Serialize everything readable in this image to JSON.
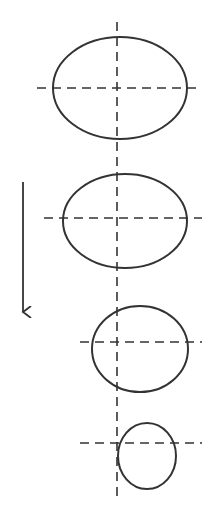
{
  "diagram": {
    "title": "",
    "colors": {
      "stroke": "#333333",
      "background": "#ffffff"
    },
    "vertical_axis": {
      "x": 117,
      "y1": 22,
      "y2": 497
    },
    "arrow": {
      "x": 23,
      "y1": 182,
      "y2": 312,
      "direction": "down"
    },
    "shapes": [
      {
        "id": "ellipse-1",
        "cx": 120,
        "cy": 88,
        "rx": 67,
        "ry": 51,
        "hline": {
          "y": 88,
          "x1": 37,
          "x2": 202
        }
      },
      {
        "id": "ellipse-2",
        "cx": 125,
        "cy": 221,
        "rx": 62,
        "ry": 47,
        "hline": {
          "y": 218,
          "x1": 44,
          "x2": 202
        }
      },
      {
        "id": "ellipse-3",
        "cx": 140,
        "cy": 349,
        "rx": 48,
        "ry": 43,
        "hline": {
          "y": 342,
          "x1": 80,
          "x2": 202
        }
      },
      {
        "id": "ellipse-4",
        "cx": 147,
        "cy": 456,
        "rx": 29,
        "ry": 33,
        "hline": {
          "y": 443,
          "x1": 80,
          "x2": 202
        }
      }
    ]
  }
}
